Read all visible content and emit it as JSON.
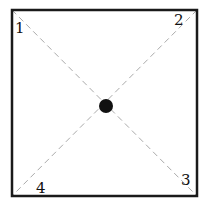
{
  "diagram": {
    "square": {
      "x": 12,
      "y": 10,
      "width": 185,
      "height": 186,
      "stroke": "#1a1a1a",
      "stroke_width": 2.5
    },
    "diagonals": {
      "stroke": "#aaaaaa",
      "dash": "6,4"
    },
    "center_dot": {
      "cx": 106,
      "cy": 106,
      "r": 7,
      "fill": "#111111"
    },
    "corner_labels": [
      {
        "text": "1",
        "x": 15,
        "y": 33
      },
      {
        "text": "2",
        "x": 174,
        "y": 25
      },
      {
        "text": "3",
        "x": 181,
        "y": 185
      },
      {
        "text": "4",
        "x": 36,
        "y": 193
      }
    ]
  }
}
